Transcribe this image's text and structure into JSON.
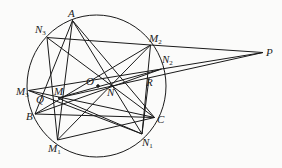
{
  "diagram": {
    "type": "geometry",
    "circle": {
      "cx": 96.5,
      "cy": 86,
      "rx": 69.5,
      "ry": 71
    },
    "points": {
      "A": {
        "x": 72.5,
        "y": 20.5
      },
      "N3": {
        "x": 47,
        "y": 37.5
      },
      "M2": {
        "x": 150.5,
        "y": 45
      },
      "N2": {
        "x": 161.5,
        "y": 69
      },
      "R": {
        "x": 149,
        "y": 78
      },
      "M3": {
        "x": 28.5,
        "y": 90.5
      },
      "M": {
        "x": 58,
        "y": 98
      },
      "Q": {
        "x": 93.5,
        "y": 85
      },
      "B": {
        "x": 35,
        "y": 114
      },
      "C": {
        "x": 154.5,
        "y": 117.5
      },
      "N1": {
        "x": 142,
        "y": 134
      },
      "M1": {
        "x": 57.5,
        "y": 140
      },
      "P": {
        "x": 263,
        "y": 52.5
      }
    },
    "labels": [
      {
        "id": "A",
        "main": "A",
        "sub": "",
        "x": 68,
        "y": 17
      },
      {
        "id": "N3",
        "main": "N",
        "sub": "3",
        "x": 35,
        "y": 33
      },
      {
        "id": "M2",
        "main": "M",
        "sub": "2",
        "x": 149,
        "y": 42
      },
      {
        "id": "N2",
        "main": "N",
        "sub": "2",
        "x": 162,
        "y": 63
      },
      {
        "id": "R",
        "main": "R",
        "sub": "",
        "x": 146,
        "y": 86
      },
      {
        "id": "P",
        "main": "P",
        "sub": "",
        "x": 266,
        "y": 56
      },
      {
        "id": "M3",
        "main": "M",
        "sub": "3",
        "x": 16,
        "y": 95
      },
      {
        "id": "Q",
        "main": "Q",
        "sub": "",
        "x": 36,
        "y": 103
      },
      {
        "id": "M",
        "main": "M",
        "sub": "",
        "x": 54,
        "y": 95
      },
      {
        "id": "O",
        "main": "O",
        "sub": "",
        "x": 86,
        "y": 85
      },
      {
        "id": "N",
        "main": "N",
        "sub": "",
        "x": 107,
        "y": 96
      },
      {
        "id": "B",
        "main": "B",
        "sub": "",
        "x": 26,
        "y": 120
      },
      {
        "id": "C",
        "main": "C",
        "sub": "",
        "x": 157,
        "y": 123
      },
      {
        "id": "N1",
        "main": "N",
        "sub": "1",
        "x": 142,
        "y": 146
      },
      {
        "id": "M1",
        "main": "M",
        "sub": "1",
        "x": 48,
        "y": 152
      }
    ],
    "segments": [
      [
        "A",
        "M1"
      ],
      [
        "A",
        "B"
      ],
      [
        "A",
        "N1"
      ],
      [
        "A",
        "C"
      ],
      [
        "N3",
        "M2"
      ],
      [
        "N3",
        "M1"
      ],
      [
        "N3",
        "C"
      ],
      [
        "M2",
        "P"
      ],
      [
        "M2",
        "M1"
      ],
      [
        "M2",
        "N1"
      ],
      [
        "M2",
        "B"
      ],
      [
        "M3",
        "N2"
      ],
      [
        "M3",
        "C"
      ],
      [
        "M3",
        "N1"
      ],
      [
        "B",
        "C"
      ],
      [
        "B",
        "N2"
      ],
      [
        "M",
        "N2"
      ],
      [
        "M",
        "P"
      ],
      [
        "N2",
        "P"
      ],
      [
        "M",
        "N1"
      ],
      [
        "R",
        "N1"
      ],
      [
        "M1",
        "C"
      ]
    ],
    "center_dot": {
      "x": 98,
      "y": 86
    }
  }
}
